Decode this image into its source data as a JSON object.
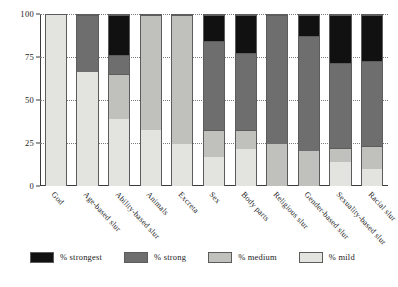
{
  "chart_data": {
    "type": "bar",
    "stacked": true,
    "stack_total": 100,
    "title": "",
    "xlabel": "",
    "ylabel": "",
    "ylim": [
      0,
      100
    ],
    "yticks": [
      0,
      25,
      50,
      75,
      100
    ],
    "ytick_labels": [
      "0",
      "25",
      "50",
      "75",
      "100"
    ],
    "grid": "horizontal-dotted",
    "legend_position": "bottom-left",
    "categories": [
      "God",
      "Age-based slur",
      "Ability-based slur",
      "Animals",
      "Excreta",
      "Sex",
      "Body parts",
      "Religious slur",
      "Gender-based slur",
      "Sexuality-based slur",
      "Racial slur"
    ],
    "series": [
      {
        "name": "% mild",
        "color": "#e3e3df",
        "values": [
          100,
          67,
          40,
          33,
          25,
          17,
          22,
          0,
          0,
          14,
          10
        ]
      },
      {
        "name": "% medium",
        "color": "#c0c0bd",
        "values": [
          0,
          0,
          26,
          67,
          75,
          16,
          11,
          25,
          21,
          8,
          13
        ]
      },
      {
        "name": "% strong",
        "color": "#6e6e6e",
        "values": [
          0,
          33,
          11,
          0,
          0,
          52,
          45,
          75,
          67,
          50,
          50
        ]
      },
      {
        "name": "% strongest",
        "color": "#111111",
        "values": [
          0,
          0,
          23,
          0,
          0,
          15,
          22,
          0,
          12,
          28,
          27
        ]
      }
    ]
  },
  "legend": {
    "items": [
      {
        "label": "% strongest",
        "color": "#111111",
        "swatch_name": "legend-swatch-strongest"
      },
      {
        "label": "% strong",
        "color": "#6e6e6e",
        "swatch_name": "legend-swatch-strong"
      },
      {
        "label": "% medium",
        "color": "#c0c0bd",
        "swatch_name": "legend-swatch-medium"
      },
      {
        "label": "% mild",
        "color": "#e3e3df",
        "swatch_name": "legend-swatch-mild"
      }
    ]
  },
  "axis": {
    "y_max_label": "100",
    "y_min_label": "0"
  }
}
